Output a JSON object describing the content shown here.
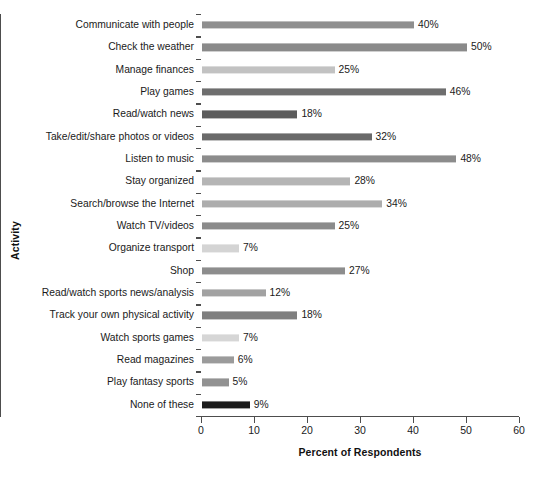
{
  "chart_data": {
    "type": "bar",
    "orientation": "horizontal",
    "title": "",
    "xlabel": "Percent of Respondents",
    "ylabel": "Activity",
    "xlim": [
      0,
      60
    ],
    "xticks": [
      0,
      10,
      20,
      30,
      40,
      50,
      60
    ],
    "grid": false,
    "legend": null,
    "value_suffix": "%",
    "categories": [
      "Communicate with people",
      "Check the weather",
      "Manage finances",
      "Play games",
      "Read/watch news",
      "Take/edit/share photos or videos",
      "Listen to music",
      "Stay organized",
      "Search/browse the Internet",
      "Watch TV/videos",
      "Organize transport",
      "Shop",
      "Read/watch sports news/analysis",
      "Track your own physical activity",
      "Watch sports games",
      "Read magazines",
      "Play fantasy sports",
      "None of these"
    ],
    "values": [
      40,
      50,
      25,
      46,
      18,
      32,
      48,
      28,
      34,
      25,
      7,
      27,
      12,
      18,
      7,
      6,
      5,
      9
    ],
    "value_labels": [
      "40%",
      "50%",
      "25%",
      "46%",
      "18%",
      "32%",
      "48%",
      "28%",
      "34%",
      "25%",
      "7%",
      "27%",
      "12%",
      "18%",
      "7%",
      "6%",
      "5%",
      "9%"
    ],
    "bar_colors": [
      "#8f8f8f",
      "#8a8a8a",
      "#c2c2c2",
      "#6e6e6e",
      "#5c5c5c",
      "#6a6a6a",
      "#8c8c8c",
      "#b5b5b5",
      "#adadad",
      "#8b8b8b",
      "#d4d4d4",
      "#8d8d8d",
      "#a2a2a2",
      "#7f7f7f",
      "#d6d6d6",
      "#9b9b9b",
      "#929292",
      "#1c1c1c"
    ],
    "axis_color": "#4d4d4d",
    "background": "#ffffff"
  }
}
